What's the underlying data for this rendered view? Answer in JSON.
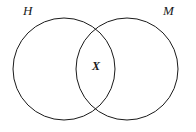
{
  "diagram": {
    "type": "venn-two-set",
    "background_color": "#ffffff",
    "stroke_color": "#1a1a1a",
    "stroke_width": 1,
    "fill": "none",
    "sets": [
      {
        "id": "left",
        "label": "H",
        "label_position": "top-left",
        "center_x": 64,
        "center_y": 69,
        "radius": 51
      },
      {
        "id": "right",
        "label": "M",
        "label_position": "top-right",
        "center_x": 127,
        "center_y": 69,
        "radius": 51
      }
    ],
    "region_markers": [
      {
        "id": "intersection",
        "label": "X",
        "region": "H-and-M",
        "x": 98,
        "y": 67,
        "style": "bold-italic"
      }
    ]
  }
}
